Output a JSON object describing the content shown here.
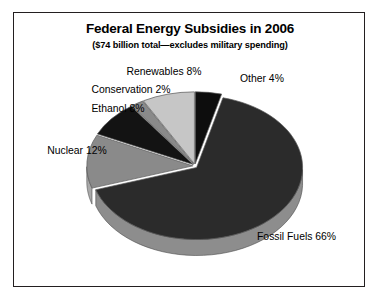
{
  "chart": {
    "title": "Federal Energy Subsidies in 2006",
    "subtitle": "($74 billion total—excludes military spending)"
  },
  "chart_data": {
    "type": "pie",
    "title": "Federal Energy Subsidies in 2006",
    "subtitle": "($74 billion total—excludes military spending)",
    "xlabel": "",
    "ylabel": "",
    "units": "percent of $74 billion total",
    "total_label": "$74 billion total",
    "legend": "none (direct slice labels)",
    "grid": false,
    "three_d": true,
    "categories": [
      "Other",
      "Fossil Fuels",
      "Nuclear",
      "Ethanol",
      "Conservation",
      "Renewables"
    ],
    "values": [
      4,
      66,
      12,
      8,
      2,
      8
    ],
    "slices": [
      {
        "name": "Other",
        "value": 4,
        "label": "Other 4%",
        "color": "#0d0d0d",
        "side_color": "#6f6f6f"
      },
      {
        "name": "Fossil Fuels",
        "value": 66,
        "label": "Fossil Fuels 66%",
        "color": "#2b2b2b",
        "side_color": "#8d8d8d"
      },
      {
        "name": "Nuclear",
        "value": 12,
        "label": "Nuclear 12%",
        "color": "#8a8a8a",
        "side_color": "#a9a9a9"
      },
      {
        "name": "Ethanol",
        "value": 8,
        "label": "Ethanol 8%",
        "color": "#131313",
        "side_color": "#6f6f6f"
      },
      {
        "name": "Conservation",
        "value": 2,
        "label": "Conservation 2%",
        "color": "#8a8a8a",
        "side_color": "#a9a9a9"
      },
      {
        "name": "Renewables",
        "value": 8,
        "label": "Renewables 8%",
        "color": "#c6c6c6",
        "side_color": "#b5b5b5"
      }
    ],
    "labels": {
      "other": "Other 4%",
      "fossil_fuels": "Fossil Fuels 66%",
      "nuclear": "Nuclear 12%",
      "ethanol": "Ethanol 8%",
      "conservation": "Conservation 2%",
      "renewables": "Renewables 8%"
    }
  }
}
